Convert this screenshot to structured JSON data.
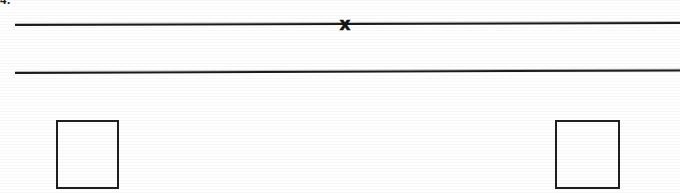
{
  "page": {
    "background_color": "#ffffff",
    "ink_color": "#1a1a1a",
    "width": 680,
    "height": 193,
    "medium": "scanned worksheet fragment"
  },
  "item_label": {
    "text": "4.",
    "note": "cropped at top edge of the page"
  },
  "lines": [
    {
      "name": "upper-rule",
      "x1": 15,
      "y1": 25,
      "x2": 680,
      "y2": 23,
      "thickness": 2,
      "color": "#1a1a1a"
    },
    {
      "name": "lower-rule",
      "x1": 15,
      "y1": 72,
      "x2": 680,
      "y2": 70,
      "thickness": 2,
      "color": "#1a1a1a"
    }
  ],
  "marker": {
    "glyph": "x",
    "label": "x-mark",
    "x": 345,
    "y": 24,
    "on_line": "upper-rule",
    "color": "#141414"
  },
  "boxes": [
    {
      "name": "left-answer-box",
      "value": "",
      "x": 56,
      "y": 120,
      "width": 63,
      "height": 69,
      "border_color": "#1f1f1f"
    },
    {
      "name": "right-answer-box",
      "value": "",
      "x": 555,
      "y": 120,
      "width": 65,
      "height": 69,
      "border_color": "#1f1f1f"
    }
  ]
}
